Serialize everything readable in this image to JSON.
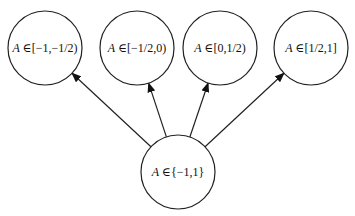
{
  "diagram": {
    "type": "tree",
    "root": {
      "id": "root",
      "label_var": "A",
      "label_rest": " ∈{−1,1}",
      "cx": 178,
      "cy": 172,
      "r": 37
    },
    "children": [
      {
        "id": "c1",
        "label_var": "A",
        "label_rest": " ∈[−1,−1/2)",
        "cx": 45,
        "cy": 48,
        "r": 37
      },
      {
        "id": "c2",
        "label_var": "A",
        "label_rest": " ∈[−1/2,0)",
        "cx": 137,
        "cy": 48,
        "r": 37
      },
      {
        "id": "c3",
        "label_var": "A",
        "label_rest": " ∈[0,1/2)",
        "cx": 220,
        "cy": 48,
        "r": 37
      },
      {
        "id": "c4",
        "label_var": "A",
        "label_rest": " ∈[1/2,1]",
        "cx": 311,
        "cy": 48,
        "r": 37
      }
    ],
    "edges": [
      {
        "from": "root",
        "to": "c1"
      },
      {
        "from": "root",
        "to": "c2"
      },
      {
        "from": "root",
        "to": "c3"
      },
      {
        "from": "root",
        "to": "c4"
      }
    ],
    "colors": {
      "stroke": "#222222",
      "background": "#ffffff"
    }
  }
}
